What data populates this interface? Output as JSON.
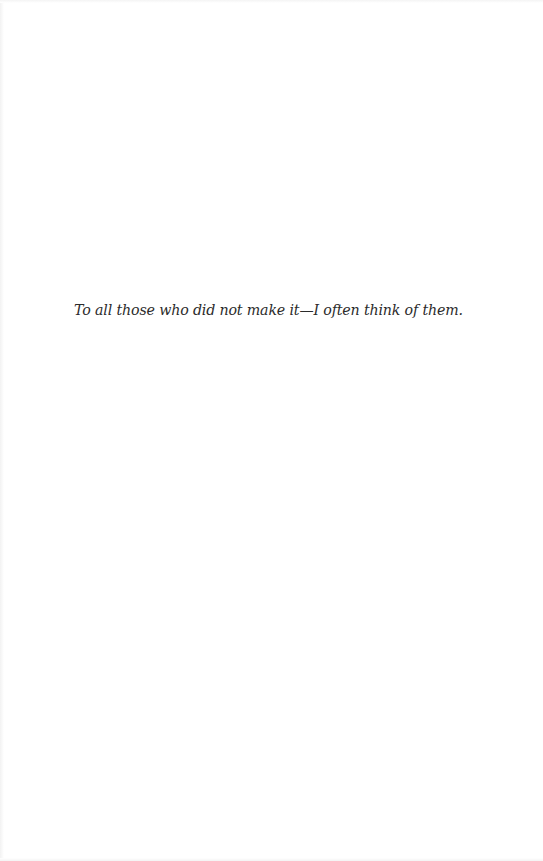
{
  "page": {
    "type": "dedication",
    "background_color": "#ffffff",
    "text_color": "#2b2b2b"
  },
  "dedication": {
    "text": "To all those who did not make it—I often think of them."
  }
}
